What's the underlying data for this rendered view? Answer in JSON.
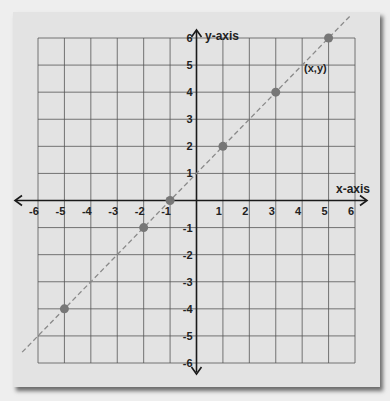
{
  "chart_data": {
    "type": "scatter",
    "title": "",
    "xlabel": "x-axis",
    "ylabel": "y-axis",
    "xlim": [
      -6,
      6
    ],
    "ylim": [
      -6,
      6
    ],
    "grid": true,
    "x_ticks": [
      "-6",
      "-5",
      "-4",
      "-3",
      "-2",
      "-1",
      "1",
      "2",
      "3",
      "4",
      "5",
      "6"
    ],
    "y_ticks": [
      "6",
      "5",
      "4",
      "3",
      "2",
      "1",
      "-1",
      "-2",
      "-3",
      "-4",
      "-5",
      "-6"
    ],
    "series": [
      {
        "name": "points",
        "x": [
          5,
          3,
          1,
          -1,
          -2,
          -5
        ],
        "y": [
          6,
          4,
          2,
          0,
          -1,
          -4
        ],
        "color": "#777777"
      }
    ],
    "line": {
      "equation": "y = x + 1",
      "style": "dashed",
      "color": "#8a8a8a",
      "x_range": [
        -6.6,
        5.8
      ]
    },
    "annotations": [
      {
        "text": "(x,y)",
        "x": 4.3,
        "y": 4.9
      }
    ]
  },
  "colors": {
    "background": "#eeeeee",
    "card": "#e3e3e3",
    "grid": "#555555",
    "axis": "#1a1a1a",
    "point": "#777777"
  }
}
